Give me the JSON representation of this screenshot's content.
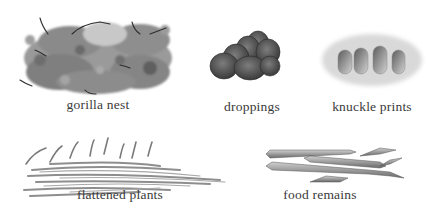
{
  "figure": {
    "background": "#ffffff",
    "items": [
      {
        "id": "gorilla-nest",
        "label": "gorilla nest"
      },
      {
        "id": "droppings",
        "label": "droppings"
      },
      {
        "id": "knuckle-prints",
        "label": "knuckle prints"
      },
      {
        "id": "flattened-plants",
        "label": "flattened plants"
      },
      {
        "id": "food-remains",
        "label": "food remains"
      }
    ]
  }
}
